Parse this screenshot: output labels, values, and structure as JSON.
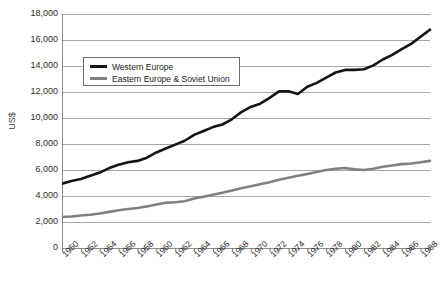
{
  "chart_data": {
    "type": "line",
    "title": "",
    "xlabel": "",
    "ylabel": "US$",
    "ylim": [
      0,
      18000
    ],
    "ytick_step": 2000,
    "ytick_labels": [
      "18,000",
      "16,000",
      "14,000",
      "12,000",
      "10,000",
      "8,000",
      "6,000",
      "4,000",
      "2,000",
      "0"
    ],
    "ytick_values": [
      18000,
      16000,
      14000,
      12000,
      10000,
      8000,
      6000,
      4000,
      2000,
      0
    ],
    "grid": "horizontal",
    "grid_color": "#a6a6a6",
    "xlim": [
      1950,
      1989
    ],
    "xtick_labels": [
      "1950",
      "1952",
      "1954",
      "1956",
      "1958",
      "1960",
      "1962",
      "1964",
      "1966",
      "1968",
      "1970",
      "1972",
      "1974",
      "1976",
      "1978",
      "1980",
      "1982",
      "1984",
      "1986",
      "1988"
    ],
    "xtick_values": [
      1950,
      1952,
      1954,
      1956,
      1958,
      1960,
      1962,
      1964,
      1966,
      1968,
      1970,
      1972,
      1974,
      1976,
      1978,
      1980,
      1982,
      1984,
      1986,
      1988
    ],
    "minor_xticks_every": 1,
    "legend_position": "upper-left-inside",
    "legend": [
      "Western Europe",
      "Eastern Europe & Soviet Union"
    ],
    "x": [
      1950,
      1951,
      1952,
      1953,
      1954,
      1955,
      1956,
      1957,
      1958,
      1959,
      1960,
      1961,
      1962,
      1963,
      1964,
      1965,
      1966,
      1967,
      1968,
      1969,
      1970,
      1971,
      1972,
      1973,
      1974,
      1975,
      1976,
      1977,
      1978,
      1979,
      1980,
      1981,
      1982,
      1983,
      1984,
      1985,
      1986,
      1987,
      1988,
      1989
    ],
    "series": [
      {
        "name": "Western Europe",
        "color": "#141414",
        "width": 2.6,
        "values": [
          4950,
          5150,
          5300,
          5550,
          5800,
          6150,
          6400,
          6600,
          6700,
          6950,
          7350,
          7650,
          7950,
          8250,
          8700,
          9000,
          9300,
          9500,
          9900,
          10450,
          10850,
          11100,
          11550,
          12050,
          12050,
          11850,
          12400,
          12700,
          13100,
          13500,
          13700,
          13700,
          13750,
          14050,
          14500,
          14850,
          15300,
          15700,
          16250,
          16800
        ]
      },
      {
        "name": "Eastern Europe & Soviet Union",
        "color": "#808080",
        "width": 2.6,
        "values": [
          2380,
          2420,
          2500,
          2560,
          2650,
          2780,
          2900,
          3000,
          3080,
          3200,
          3350,
          3480,
          3520,
          3600,
          3800,
          3950,
          4100,
          4250,
          4420,
          4600,
          4750,
          4900,
          5050,
          5250,
          5400,
          5550,
          5700,
          5850,
          6000,
          6100,
          6150,
          6050,
          6000,
          6100,
          6250,
          6350,
          6450,
          6500,
          6600,
          6700
        ]
      }
    ]
  }
}
